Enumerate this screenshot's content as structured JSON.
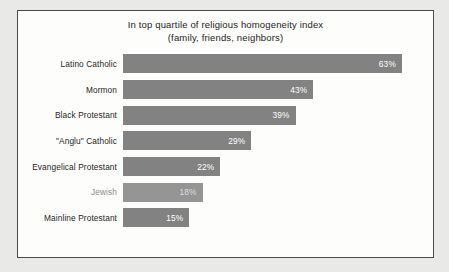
{
  "figure": {
    "title_line1": "In top quartile of religious homogeneity index",
    "title_line2": "(family, friends, neighbors)",
    "background_color": "#fdfdfc",
    "border_color": "#4a4a48",
    "page_background": "#e9e9e7"
  },
  "chart_data": {
    "type": "bar",
    "orientation": "horizontal",
    "title": "In top quartile of religious homogeneity index (family, friends, neighbors)",
    "xlabel": "",
    "ylabel": "",
    "xlim": [
      0,
      70
    ],
    "grid": false,
    "legend": false,
    "bar_color": "#828282",
    "value_label_color": "#ffffff",
    "categories": [
      "Latino Catholic",
      "Mormon",
      "Black Protestant",
      "\"Anglu\" Catholic",
      "Evangelical Protestant",
      "Jewish",
      "Mainline Protestant"
    ],
    "values": [
      63,
      43,
      39,
      29,
      22,
      18,
      15
    ],
    "value_labels": [
      "63%",
      "43%",
      "39%",
      "29%",
      "22%",
      "18%",
      "15%"
    ],
    "points": [
      {
        "category": "Latino Catholic",
        "value": 63,
        "label": "63%",
        "faded": false
      },
      {
        "category": "Mormon",
        "value": 43,
        "label": "43%",
        "faded": false
      },
      {
        "category": "Black Protestant",
        "value": 39,
        "label": "39%",
        "faded": false
      },
      {
        "category": "\"Anglu\" Catholic",
        "value": 29,
        "label": "29%",
        "faded": false
      },
      {
        "category": "Evangelical Protestant",
        "value": 22,
        "label": "22%",
        "faded": false
      },
      {
        "category": "Jewish",
        "value": 18,
        "label": "18%",
        "faded": true
      },
      {
        "category": "Mainline Protestant",
        "value": 15,
        "label": "15%",
        "faded": false
      }
    ]
  }
}
